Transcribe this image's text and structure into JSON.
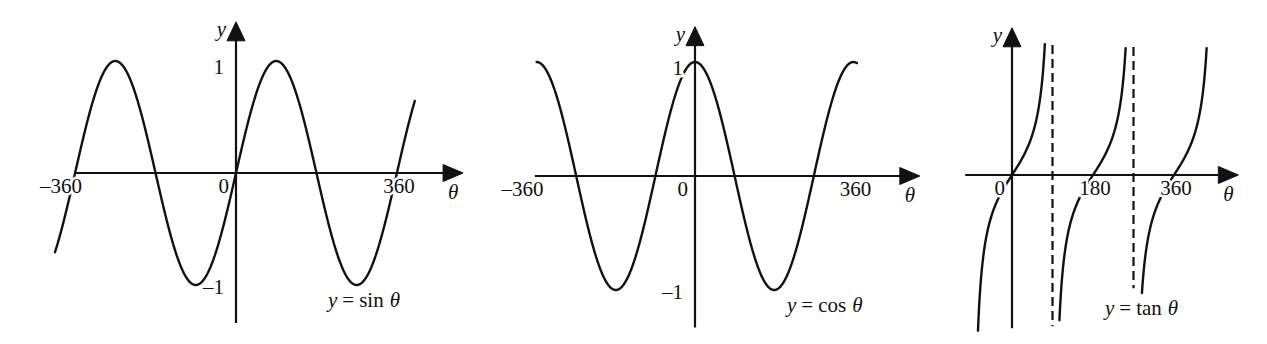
{
  "chart_data": [
    {
      "type": "line",
      "title": "",
      "xlabel": "θ",
      "ylabel": "y",
      "equation_label": {
        "lhs": "y",
        "operator": "=",
        "function": "sin",
        "variable": "θ"
      },
      "xlim": [
        -360,
        508
      ],
      "ylim": [
        -1.34,
        1.35
      ],
      "grid": false,
      "x_ticks": [
        {
          "value": -360,
          "label": "–360"
        },
        {
          "value": 0,
          "label": "0"
        },
        {
          "value": 360,
          "label": "360"
        }
      ],
      "y_ticks": [
        {
          "value": 1,
          "label": "1"
        },
        {
          "value": -1,
          "label": "–1"
        }
      ],
      "series": [
        {
          "name": "sin θ",
          "function": "sin",
          "branches": [
            [
              -405,
              400
            ]
          ],
          "points": [
            [
              -360,
              0
            ],
            [
              -270,
              1
            ],
            [
              -180,
              0
            ],
            [
              -90,
              -1
            ],
            [
              0,
              0
            ],
            [
              90,
              1
            ],
            [
              180,
              0
            ],
            [
              270,
              -1
            ],
            [
              360,
              0
            ]
          ]
        }
      ],
      "asymptotes": []
    },
    {
      "type": "line",
      "title": "",
      "xlabel": "θ",
      "ylabel": "y",
      "equation_label": {
        "lhs": "y",
        "operator": "=",
        "function": "cos",
        "variable": "θ"
      },
      "xlim": [
        -364,
        511
      ],
      "ylim": [
        -1.33,
        1.31
      ],
      "grid": false,
      "x_ticks": [
        {
          "value": -360,
          "label": "–360"
        },
        {
          "value": 0,
          "label": "0"
        },
        {
          "value": 360,
          "label": "360"
        }
      ],
      "y_ticks": [
        {
          "value": 1,
          "label": "1"
        },
        {
          "value": -1,
          "label": "–1"
        }
      ],
      "series": [
        {
          "name": "cos θ",
          "function": "cos",
          "branches": [
            [
              -360,
              368
            ]
          ],
          "points": [
            [
              -360,
              1
            ],
            [
              -270,
              0
            ],
            [
              -180,
              -1
            ],
            [
              -90,
              0
            ],
            [
              0,
              1
            ],
            [
              90,
              0
            ],
            [
              180,
              -1
            ],
            [
              270,
              0
            ],
            [
              360,
              1
            ]
          ]
        }
      ],
      "asymptotes": []
    },
    {
      "type": "line",
      "title": "",
      "xlabel": "θ",
      "ylabel": "y",
      "equation_label": {
        "lhs": "y",
        "operator": "=",
        "function": "tan",
        "variable": "θ"
      },
      "xlim": [
        -104,
        503
      ],
      "ylim": [
        -3.83,
        3.68
      ],
      "grid": false,
      "x_ticks": [
        {
          "value": 0,
          "label": "0"
        },
        {
          "value": 180,
          "label": "180"
        },
        {
          "value": 360,
          "label": "360"
        }
      ],
      "y_ticks": [],
      "series": [
        {
          "name": "tan θ",
          "function": "tan",
          "branches": [
            [
              -75.6,
              73
            ],
            [
              105.4,
              252.5
            ],
            [
              288.7,
              432.5
            ]
          ],
          "points": [
            [
              0,
              0
            ],
            [
              45,
              1
            ],
            [
              135,
              -1
            ],
            [
              180,
              0
            ],
            [
              225,
              1
            ],
            [
              315,
              -1
            ],
            [
              360,
              0
            ]
          ]
        }
      ],
      "asymptotes": [
        {
          "x": 90,
          "y_range": [
            -3.78,
            3.25
          ]
        },
        {
          "x": 270,
          "y_range": [
            -2.83,
            3.2
          ]
        }
      ]
    }
  ]
}
